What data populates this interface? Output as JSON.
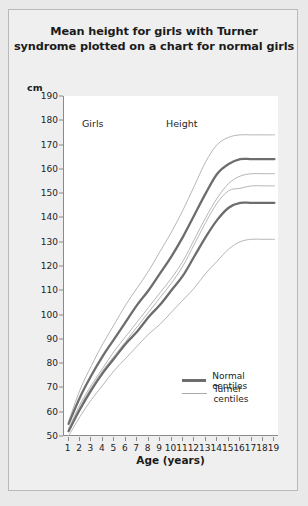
{
  "figure": {
    "title_line1": "Mean height for girls with Turner",
    "title_line2": "syndrome plotted on a chart for normal girls"
  },
  "axes": {
    "y_unit_label": "cm",
    "x_title": "Age  (years)"
  },
  "annotations": {
    "girls": "Girls",
    "height": "Height"
  },
  "legend": {
    "normal": "Normal centiles",
    "turner": "Turner centiles"
  },
  "colors": {
    "normal_line": "#6d6d6d",
    "turner_line": "#a9a9a9",
    "axis": "#8a8a8a",
    "panel_bg": "#f0efef",
    "plot_bg": "#ffffff",
    "page_bg": "#e9e9e9",
    "text": "#1b1b1b"
  },
  "chart_data": {
    "type": "line",
    "title": "Mean height for girls with Turner syndrome plotted on a chart for normal girls",
    "xlabel": "Age (years)",
    "ylabel": "cm",
    "xlim": [
      0.6,
      19.4
    ],
    "ylim": [
      50,
      190
    ],
    "xticks": [
      1,
      2,
      3,
      4,
      5,
      6,
      7,
      8,
      9,
      10,
      11,
      12,
      13,
      14,
      15,
      16,
      17,
      18,
      19
    ],
    "yticks": [
      50,
      60,
      70,
      80,
      90,
      100,
      110,
      120,
      130,
      140,
      150,
      160,
      170,
      180,
      190
    ],
    "grid": false,
    "legend_position": "bottom-right",
    "x": [
      1,
      2,
      3,
      4,
      5,
      6,
      7,
      8,
      9,
      10,
      11,
      12,
      13,
      14,
      15,
      16,
      17,
      18,
      19
    ],
    "series": [
      {
        "name": "Normal centiles upper",
        "group": "Normal centiles",
        "style": "thick",
        "color": "#6d6d6d",
        "values": [
          55,
          66,
          75,
          83,
          90,
          97,
          104,
          110,
          117,
          124,
          132,
          141,
          150,
          158,
          162,
          164,
          164,
          164,
          164
        ]
      },
      {
        "name": "Normal centiles lower",
        "group": "Normal centiles",
        "style": "thick",
        "color": "#6d6d6d",
        "values": [
          52,
          61,
          69,
          76,
          82,
          88,
          93,
          99,
          104,
          110,
          116,
          124,
          132,
          139,
          144,
          146,
          146,
          146,
          146
        ]
      },
      {
        "name": "Turner centile 1 (upper normal range)",
        "group": "Turner centiles",
        "style": "thin",
        "color": "#a9a9a9",
        "values": [
          56,
          69,
          79,
          88,
          96,
          104,
          111,
          118,
          126,
          134,
          143,
          153,
          163,
          170,
          173,
          174,
          174,
          174,
          174
        ]
      },
      {
        "name": "Turner centile 2",
        "group": "Turner centiles",
        "style": "thin",
        "color": "#a9a9a9",
        "values": [
          53,
          63,
          71,
          78,
          85,
          91,
          97,
          103,
          109,
          115,
          122,
          131,
          140,
          148,
          154,
          157,
          158,
          158,
          158
        ]
      },
      {
        "name": "Turner centile 3",
        "group": "Turner centiles",
        "style": "thin",
        "color": "#a9a9a9",
        "values": [
          52,
          62,
          70,
          77,
          83,
          89,
          95,
          101,
          107,
          113,
          120,
          129,
          138,
          146,
          151,
          152,
          153,
          153,
          153
        ]
      },
      {
        "name": "Turner centile 4 (lower)",
        "group": "Turner centiles",
        "style": "thin",
        "color": "#a9a9a9",
        "values": [
          50,
          58,
          65,
          71,
          77,
          82,
          87,
          92,
          96,
          101,
          106,
          111,
          117,
          122,
          127,
          130,
          131,
          131,
          131
        ]
      }
    ]
  }
}
